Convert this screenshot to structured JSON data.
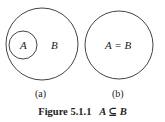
{
  "figure": {
    "caption_prefix": "Figure 5.1.1",
    "caption_math": "A ⊆ B",
    "panels": [
      {
        "id": "a",
        "label": "(a)",
        "outer_set": "B",
        "inner_set": "A"
      },
      {
        "id": "b",
        "label": "(b)",
        "equation": "A = B"
      }
    ],
    "stroke_color": "#333333"
  }
}
